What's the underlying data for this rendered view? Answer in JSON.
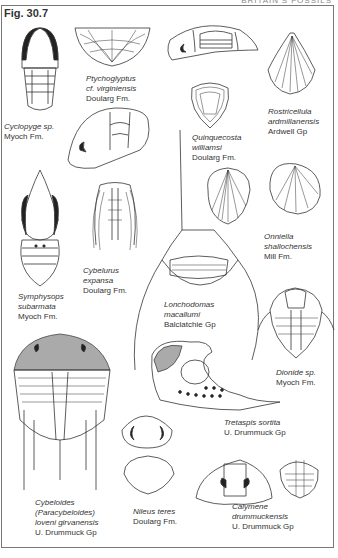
{
  "page": {
    "running_head": "BRITAIN'S FOSSILS",
    "figure_title": "Fig. 30.7"
  },
  "specimens": [
    {
      "id": "cyclopyge",
      "name_lines": [
        "Cyclopyge sp."
      ],
      "formation": "Myoch Fm."
    },
    {
      "id": "ptychoglyptus",
      "name_lines": [
        "Ptychoglyptus",
        "cf.  virginiensis"
      ],
      "formation": "Doularg Fm."
    },
    {
      "id": "rostricellula",
      "name_lines": [
        "Rostricellula",
        "ardmillanensis"
      ],
      "formation": "Ardwell Gp"
    },
    {
      "id": "quinquecosta",
      "name_lines": [
        "Quinquecosta",
        "williamsi"
      ],
      "formation": "Doularg Fm."
    },
    {
      "id": "onniella",
      "name_lines": [
        "Onniella",
        "shallochensis"
      ],
      "formation": "Mill Fm."
    },
    {
      "id": "symphysops",
      "name_lines": [
        "Symphysops",
        "subarmata"
      ],
      "formation": "Myoch Fm."
    },
    {
      "id": "cybelurus",
      "name_lines": [
        "Cybelurus",
        "expansa"
      ],
      "formation": "Doularg Fm."
    },
    {
      "id": "lonchodomas",
      "name_lines": [
        "Lonchodomas",
        "macallumi"
      ],
      "formation": "Balclatchie Gp"
    },
    {
      "id": "dionide",
      "name_lines": [
        "Dionide sp."
      ],
      "formation": "Myoch Fm."
    },
    {
      "id": "tretaspis",
      "name_lines": [
        "Tretaspis sortita"
      ],
      "formation": "U. Drummuck Gp"
    },
    {
      "id": "cybeloides",
      "name_lines": [
        "Cybeloides",
        "(Paracybeloides)",
        "loveni girvanensis"
      ],
      "formation": "U. Drummuck Gp"
    },
    {
      "id": "nileus",
      "name_lines": [
        "Nileus teres"
      ],
      "formation": "Doularg Fm."
    },
    {
      "id": "calymene",
      "name_lines": [
        "Calymene",
        "drummuckensis"
      ],
      "formation": "U. Drummuck Gp"
    }
  ]
}
